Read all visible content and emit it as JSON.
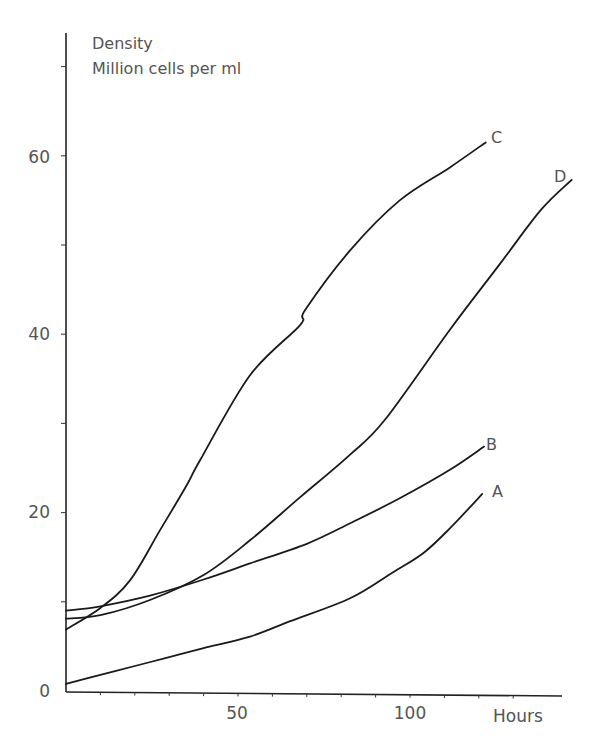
{
  "chart_data": {
    "type": "line",
    "title": "",
    "ylabel_line1": "Density",
    "ylabel_line2": "Million cells per ml",
    "xlabel": "Hours",
    "xlim": [
      0,
      143
    ],
    "ylim": [
      0,
      73
    ],
    "grid": false,
    "legend": "inline curve-end labels",
    "x_ticks": [
      10,
      20,
      30,
      40,
      50,
      60,
      70,
      80,
      90,
      100,
      110,
      120,
      130
    ],
    "x_tick_labels": [
      {
        "value": 50,
        "label": "50"
      },
      {
        "value": 100,
        "label": "100"
      }
    ],
    "y_ticks": [
      10,
      20,
      30,
      40,
      50,
      60,
      70
    ],
    "y_tick_labels": [
      {
        "value": 0,
        "label": "0"
      },
      {
        "value": 20,
        "label": "20"
      },
      {
        "value": 40,
        "label": "40"
      },
      {
        "value": 60,
        "label": "60"
      }
    ],
    "series": [
      {
        "name": "A",
        "points": [
          [
            0,
            0.8
          ],
          [
            10,
            1.8
          ],
          [
            20,
            2.8
          ],
          [
            30,
            3.8
          ],
          [
            40,
            4.8
          ],
          [
            53.5,
            6.1
          ],
          [
            65,
            7.8
          ],
          [
            82.6,
            10.4
          ],
          [
            95,
            13.3
          ],
          [
            104,
            15.5
          ],
          [
            112,
            18.4
          ],
          [
            121,
            22.1
          ]
        ]
      },
      {
        "name": "B",
        "points": [
          [
            0,
            9.0
          ],
          [
            10,
            9.5
          ],
          [
            24.4,
            10.7
          ],
          [
            40,
            12.5
          ],
          [
            53.5,
            14.3
          ],
          [
            70,
            16.5
          ],
          [
            82.6,
            18.8
          ],
          [
            97,
            21.6
          ],
          [
            111.6,
            24.8
          ],
          [
            121.5,
            27.4
          ]
        ]
      },
      {
        "name": "C",
        "points": [
          [
            0,
            6.9
          ],
          [
            10,
            9.3
          ],
          [
            18.6,
            12.4
          ],
          [
            27.3,
            18.0
          ],
          [
            35,
            23.0
          ],
          [
            39,
            25.9
          ],
          [
            53.5,
            35.4
          ],
          [
            68,
            41.0
          ],
          [
            69.5,
            42.7
          ],
          [
            82.6,
            49.4
          ],
          [
            97,
            55.0
          ],
          [
            111.6,
            58.7
          ],
          [
            122,
            61.5
          ]
        ]
      },
      {
        "name": "D",
        "points": [
          [
            0,
            8.1
          ],
          [
            10,
            8.5
          ],
          [
            24.4,
            10.2
          ],
          [
            40,
            13.0
          ],
          [
            53.5,
            16.9
          ],
          [
            68,
            21.7
          ],
          [
            82.6,
            26.5
          ],
          [
            92.7,
            30.4
          ],
          [
            111.6,
            40.5
          ],
          [
            126,
            47.8
          ],
          [
            138,
            53.9
          ],
          [
            147,
            57.3
          ]
        ]
      }
    ]
  },
  "labels": {
    "y_title_1": "Density",
    "y_title_2": "Million cells per ml",
    "x_title": "Hours",
    "tick_0": "0",
    "tick_20": "20",
    "tick_40": "40",
    "tick_60": "60",
    "tick_x50": "50",
    "tick_x100": "100",
    "curve_a": "A",
    "curve_b": "B",
    "curve_c": "C",
    "curve_d": "D"
  }
}
